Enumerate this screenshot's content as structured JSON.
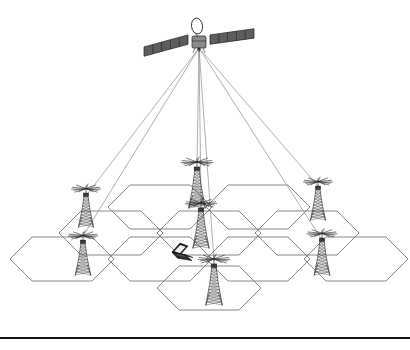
{
  "figure": {
    "background_color": "#ffffff",
    "width": 410,
    "height": 350
  },
  "colors": {
    "hex_cell_stroke": "#7a7a7a",
    "beam_stroke": "#8c8c8c",
    "tower_stroke": "#3b3b3b",
    "satellite_panel": "#5d5d5d",
    "satellite_body": "#8a8a8a",
    "laptop_body": "#2a2a2a",
    "laptop_screen": "#f2f2f2",
    "bottom_rule": "#111111"
  },
  "satellite": {
    "name": "communications-satellite",
    "center_x": 199,
    "center_y": 42,
    "panel_span": 110,
    "has_dish_antenna": true,
    "panel_segments": 5
  },
  "beams": {
    "origin_x": 199,
    "origin_y": 48,
    "count": 7,
    "targets": [
      {
        "label": "beam-to-tower-west-upper",
        "x": 86,
        "y": 196
      },
      {
        "label": "beam-to-tower-west-lower",
        "x": 83,
        "y": 236
      },
      {
        "label": "beam-to-tower-center-upper",
        "x": 197,
        "y": 163
      },
      {
        "label": "beam-to-tower-center-mid",
        "x": 201,
        "y": 204
      },
      {
        "label": "beam-to-tower-center-lower",
        "x": 214,
        "y": 261
      },
      {
        "label": "beam-to-tower-east-upper",
        "x": 318,
        "y": 186
      },
      {
        "label": "beam-to-tower-east-lower",
        "x": 322,
        "y": 240
      }
    ]
  },
  "hex_grid": {
    "name": "cellular-coverage-grid",
    "cell_count": 10,
    "cell_half_width": 52,
    "cell_half_height": 22,
    "cell_notch": 22,
    "cells": [
      {
        "id": "cell-r1-c1",
        "cx": 160,
        "cy": 207
      },
      {
        "id": "cell-r1-c2",
        "cx": 258,
        "cy": 207
      },
      {
        "id": "cell-r2-c0",
        "cx": 111,
        "cy": 233
      },
      {
        "id": "cell-r2-c1",
        "cx": 209,
        "cy": 233
      },
      {
        "id": "cell-r2-c2",
        "cx": 307,
        "cy": 233
      },
      {
        "id": "cell-r3-c0",
        "cx": 62,
        "cy": 259
      },
      {
        "id": "cell-r3-c1",
        "cx": 160,
        "cy": 259
      },
      {
        "id": "cell-r3-c2",
        "cx": 258,
        "cy": 259
      },
      {
        "id": "cell-r3-c3",
        "cx": 356,
        "cy": 259
      },
      {
        "id": "cell-r4-c1",
        "cx": 209,
        "cy": 288
      }
    ]
  },
  "towers": [
    {
      "id": "tower-west-upper",
      "label": "cell-tower",
      "base_x": 86,
      "base_y": 227,
      "height": 33,
      "scale": 1.0
    },
    {
      "id": "tower-west-lower",
      "label": "cell-tower",
      "base_x": 83,
      "base_y": 275,
      "height": 34,
      "scale": 1.02
    },
    {
      "id": "tower-center-upper",
      "label": "cell-tower",
      "base_x": 197,
      "base_y": 208,
      "height": 40,
      "scale": 1.1
    },
    {
      "id": "tower-center-mid",
      "label": "cell-tower",
      "base_x": 201,
      "base_y": 248,
      "height": 39,
      "scale": 1.08
    },
    {
      "id": "tower-center-lower",
      "label": "cell-tower",
      "base_x": 214,
      "base_y": 305,
      "height": 40,
      "scale": 1.1
    },
    {
      "id": "tower-east-upper",
      "label": "cell-tower",
      "base_x": 318,
      "base_y": 220,
      "height": 33,
      "scale": 1.0
    },
    {
      "id": "tower-east-lower",
      "label": "cell-tower",
      "base_x": 322,
      "base_y": 275,
      "height": 36,
      "scale": 1.04
    }
  ],
  "laptop": {
    "name": "mobile-terminal-laptop",
    "x": 171,
    "y": 243,
    "width": 22,
    "height": 18
  },
  "bottom_rule": {
    "name": "horizontal-divider",
    "y": 338,
    "x_start": 0,
    "x_end": 410
  }
}
